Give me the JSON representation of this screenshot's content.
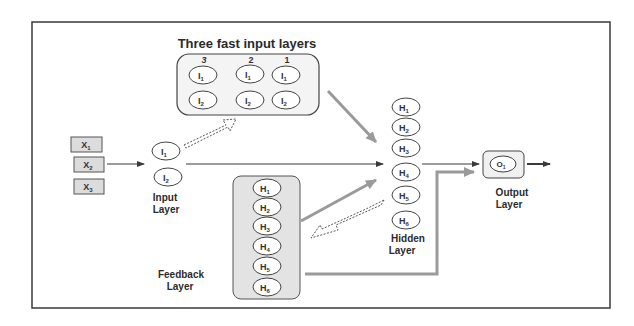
{
  "title": "Three fast input layers",
  "fast_input_layers": {
    "column_numbers": [
      "3",
      "2",
      "1"
    ],
    "nodes": [
      {
        "name": "I",
        "sub": "1"
      },
      {
        "name": "I",
        "sub": "2"
      }
    ]
  },
  "inputs": [
    {
      "name": "X",
      "sub": "1"
    },
    {
      "name": "X",
      "sub": "2"
    },
    {
      "name": "X",
      "sub": "3"
    }
  ],
  "input_layer": {
    "label_line1": "Input",
    "label_line2": "Layer",
    "nodes": [
      {
        "name": "I",
        "sub": "1"
      },
      {
        "name": "I",
        "sub": "2"
      }
    ]
  },
  "hidden_layer": {
    "label_line1": "Hidden",
    "label_line2": "Layer",
    "nodes": [
      {
        "name": "H",
        "sub": "1"
      },
      {
        "name": "H",
        "sub": "2"
      },
      {
        "name": "H",
        "sub": "3"
      },
      {
        "name": "H",
        "sub": "4"
      },
      {
        "name": "H",
        "sub": "5"
      },
      {
        "name": "H",
        "sub": "6"
      }
    ]
  },
  "feedback_layer": {
    "label_line1": "Feedback",
    "label_line2": "Layer",
    "nodes": [
      {
        "name": "H",
        "sub": "1"
      },
      {
        "name": "H",
        "sub": "2"
      },
      {
        "name": "H",
        "sub": "3"
      },
      {
        "name": "H",
        "sub": "4"
      },
      {
        "name": "H",
        "sub": "5"
      },
      {
        "name": "H",
        "sub": "6"
      }
    ]
  },
  "output_layer": {
    "label_line1": "Output",
    "label_line2": "Layer",
    "nodes": [
      {
        "name": "O",
        "sub": "1"
      }
    ]
  },
  "colors": {
    "border": "#3a3a3a",
    "gray_arrow": "#9a9a9a",
    "box_fill": "#dcdcdc",
    "panel_fill": "#e8e8e8"
  }
}
